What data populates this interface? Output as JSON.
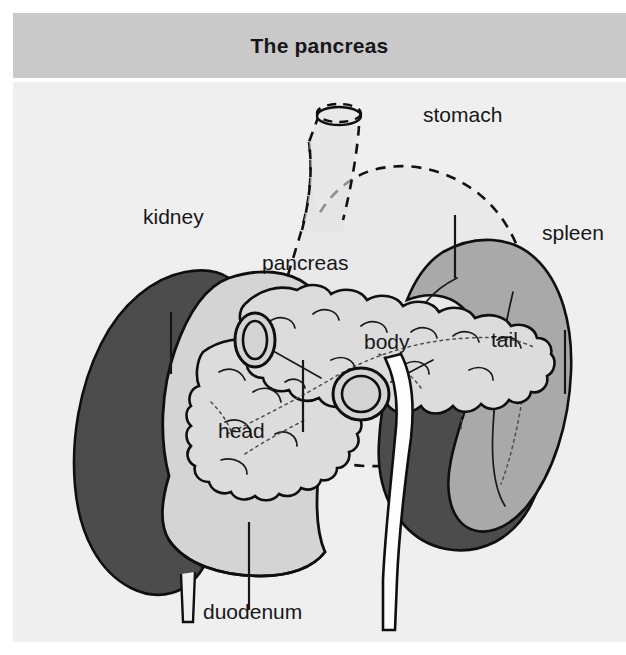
{
  "figure": {
    "title": "The pancreas",
    "title_bar_color": "#c9c9c9",
    "panel_background": "#efefef",
    "width": 626,
    "height": 655
  },
  "palette": {
    "kidney_fill": "#4c4c4c",
    "spleen_fill": "#a9a9a9",
    "duodenum_fill": "#d4d4d4",
    "pancreas_fill": "#dcdcdc",
    "stomach_fill": "#e3e3e3",
    "vessel_fill": "#fdfdfd",
    "outline": "#0f0f0f",
    "text": "#17171a"
  },
  "labels": [
    {
      "id": "kidney",
      "text": "kidney",
      "x": 130,
      "y": 224,
      "leader": true
    },
    {
      "id": "stomach",
      "text": "stomach",
      "x": 410,
      "y": 122,
      "leader": true
    },
    {
      "id": "pancreas",
      "text": "pancreas",
      "x": 249,
      "y": 270,
      "leader": true
    },
    {
      "id": "spleen",
      "text": "spleen",
      "x": 529,
      "y": 240,
      "leader": true
    },
    {
      "id": "body",
      "text": "body",
      "x": 351,
      "y": 349,
      "leader": false
    },
    {
      "id": "tail",
      "text": "tail",
      "x": 478,
      "y": 347,
      "leader": false
    },
    {
      "id": "head",
      "text": "head",
      "x": 205,
      "y": 438,
      "leader": false
    },
    {
      "id": "duodenum",
      "text": "duodenum",
      "x": 190,
      "y": 619,
      "leader": true
    }
  ],
  "structures": [
    {
      "id": "kidney",
      "name": "kidney",
      "style": "solid dark-gray silhouette"
    },
    {
      "id": "duodenum",
      "name": "duodenum",
      "style": "solid light-gray C-loop"
    },
    {
      "id": "pancreas",
      "name": "pancreas",
      "style": "lobulated gland, head body tail"
    },
    {
      "id": "spleen",
      "name": "spleen",
      "style": "medium-gray crescent"
    },
    {
      "id": "stomach",
      "name": "stomach",
      "style": "dashed outline, translucent"
    },
    {
      "id": "esophagus",
      "name": "esophagus",
      "style": "dashed tube with elliptical rim"
    },
    {
      "id": "vessel",
      "name": "aorta",
      "style": "white vertical vessel"
    }
  ]
}
